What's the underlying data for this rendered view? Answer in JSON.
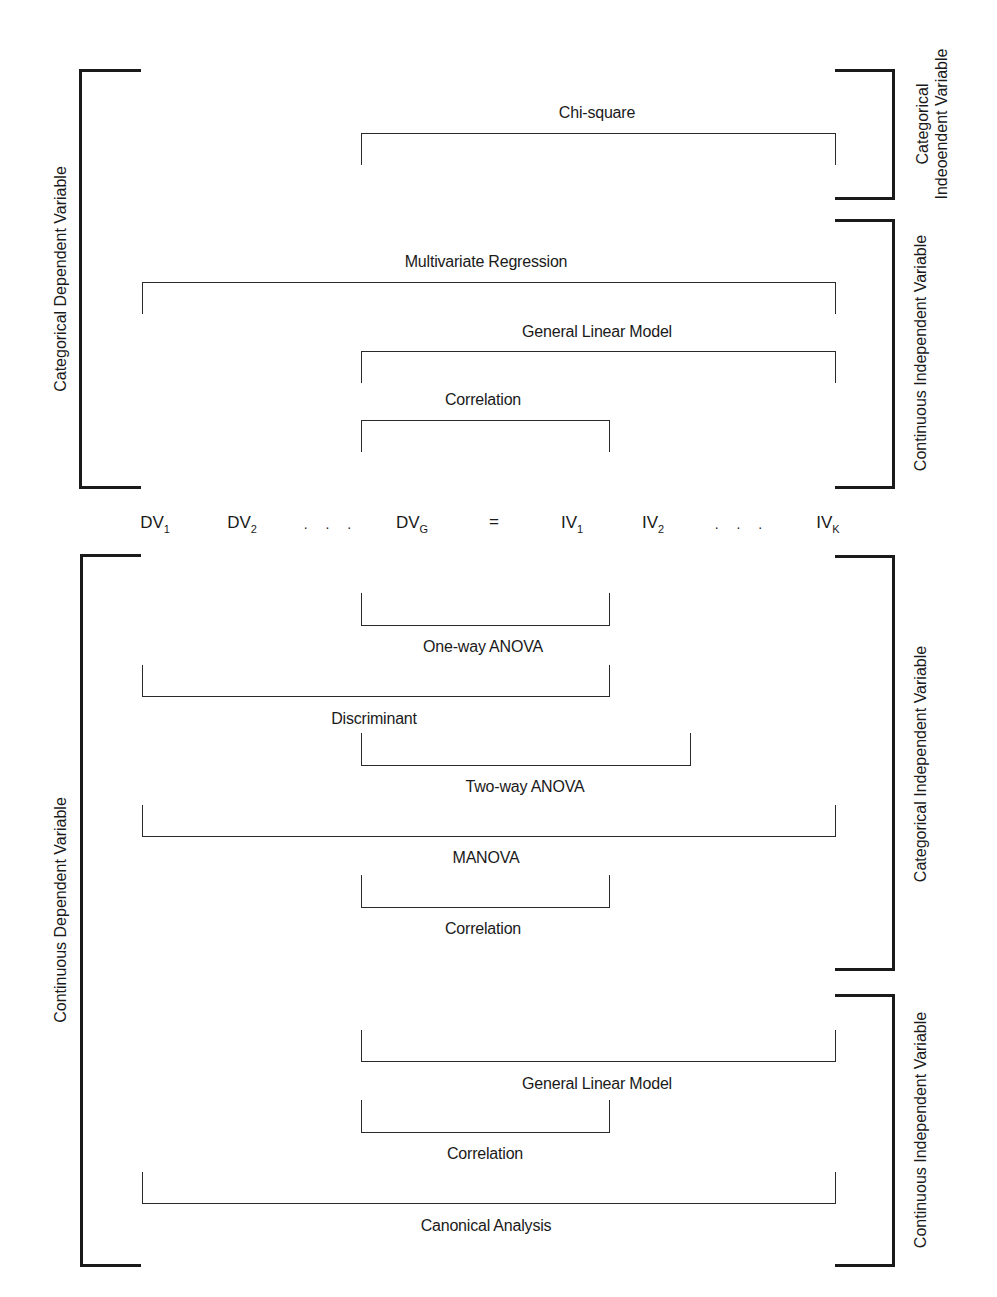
{
  "figure": {
    "equation": {
      "terms": [
        {
          "base": "DV",
          "sub": "1",
          "x": 155
        },
        {
          "base": "DV",
          "sub": "2",
          "x": 242
        },
        {
          "base": "dots",
          "text": ". . .",
          "x": 331
        },
        {
          "base": "DV",
          "sub": "G",
          "x": 412
        },
        {
          "base": "eq",
          "text": "=",
          "x": 494
        },
        {
          "base": "IV",
          "sub": "1",
          "x": 572
        },
        {
          "base": "IV",
          "sub": "2",
          "x": 653
        },
        {
          "base": "dots",
          "text": ". . .",
          "x": 742
        },
        {
          "base": "IV",
          "sub": "K",
          "x": 828
        }
      ],
      "y": 524
    },
    "left_groups": [
      {
        "label": "Categorical Dependent Variable",
        "x": 79,
        "top": 69,
        "bottom": 489,
        "label_x": 60
      },
      {
        "label": "Continuous Dependent Variable",
        "x": 80,
        "top": 554,
        "bottom": 1267,
        "label_x": 60
      }
    ],
    "right_groups": [
      {
        "label_line1": "Categorical",
        "label_line2": "Indeoendent Variable",
        "top": 69,
        "bottom": 200,
        "label_x": 932
      },
      {
        "label": "Continuous Independent Variable",
        "top": 219,
        "bottom": 489,
        "label_x": 920
      },
      {
        "label": "Categorical Independent Variable",
        "top": 555,
        "bottom": 971,
        "label_x": 920
      },
      {
        "label": "Continuous Independent Variable",
        "top": 994,
        "bottom": 1267,
        "label_x": 920
      }
    ],
    "upper_connectors": [
      {
        "label": "Chi-square",
        "x1": 361,
        "x2": 836,
        "top": 133,
        "bottom": 165,
        "label_x": 597,
        "label_y": 113
      },
      {
        "label": "Multivariate Regression",
        "x1": 142,
        "x2": 836,
        "top": 282,
        "bottom": 314,
        "label_x": 486,
        "label_y": 262
      },
      {
        "label": "General Linear Model",
        "x1": 361,
        "x2": 836,
        "top": 351,
        "bottom": 383,
        "label_x": 597,
        "label_y": 332
      },
      {
        "label": "Correlation",
        "x1": 361,
        "x2": 610,
        "top": 420,
        "bottom": 452,
        "label_x": 483,
        "label_y": 400
      }
    ],
    "lower_connectors": [
      {
        "label": "One-way ANOVA",
        "x1": 361,
        "x2": 610,
        "top": 593,
        "bottom": 626,
        "label_x": 483,
        "label_y": 647
      },
      {
        "label": "Discriminant",
        "x1": 142,
        "x2": 610,
        "top": 665,
        "bottom": 697,
        "label_x": 374,
        "label_y": 719
      },
      {
        "label": "Two-way ANOVA",
        "x1": 361,
        "x2": 691,
        "top": 733,
        "bottom": 766,
        "label_x": 525,
        "label_y": 787
      },
      {
        "label": "MANOVA",
        "x1": 142,
        "x2": 836,
        "top": 805,
        "bottom": 837,
        "label_x": 486,
        "label_y": 858
      },
      {
        "label": "Correlation",
        "x1": 361,
        "x2": 610,
        "top": 875,
        "bottom": 908,
        "label_x": 483,
        "label_y": 929
      },
      {
        "label": "General Linear Model",
        "x1": 361,
        "x2": 836,
        "top": 1030,
        "bottom": 1062,
        "label_x": 597,
        "label_y": 1084
      },
      {
        "label": "Correlation",
        "x1": 361,
        "x2": 610,
        "top": 1100,
        "bottom": 1133,
        "label_x": 485,
        "label_y": 1154
      },
      {
        "label": "Canonical Analysis",
        "x1": 142,
        "x2": 836,
        "top": 1172,
        "bottom": 1204,
        "label_x": 486,
        "label_y": 1226
      }
    ]
  }
}
